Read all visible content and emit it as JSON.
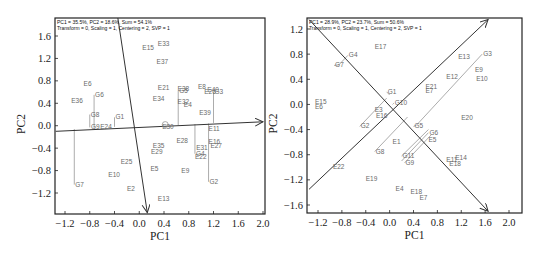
{
  "chart_data": [
    {
      "type": "scatter",
      "title": "PC1 = 35.5%, PC2 = 18.6%, Sum = 54.1%",
      "subtitle": "Transform = 0, Scaling = 1, Centering = 2, SVP = 1",
      "xlabel": "PC1",
      "ylabel": "PC2",
      "xlim": [
        -1.35,
        2.05
      ],
      "ylim": [
        -1.6,
        1.95
      ],
      "xticks": [
        -1.2,
        -0.8,
        -0.4,
        0.0,
        0.4,
        0.8,
        1.2,
        1.6,
        2.0
      ],
      "yticks": [
        1.6,
        1.2,
        0.8,
        0.4,
        0.0,
        -0.4,
        -0.8,
        -1.2
      ],
      "frame": {
        "x0": 55,
        "x1": 265,
        "y0": 18,
        "y1": 214
      },
      "axes_px": {
        "x_at": {
          "-1.2": 65,
          "2.0": 263
        },
        "y_at": {
          "1.6": 36,
          "-1.2": 193
        }
      },
      "vectors": [
        {
          "name": "axis-pc1",
          "x1": -1.35,
          "y1": -0.1,
          "x2": 2.0,
          "y2": 0.07
        },
        {
          "name": "axis-pc2",
          "x1": -0.35,
          "y1": 1.95,
          "x2": 0.13,
          "y2": -1.55
        }
      ],
      "testers": [
        {
          "label": "G6",
          "x": -0.73,
          "y": 0.55,
          "foot_y": -0.04
        },
        {
          "label": "G8",
          "x": -0.8,
          "y": 0.2,
          "foot_y": -0.03
        },
        {
          "label": "G1",
          "x": -0.4,
          "y": 0.15,
          "foot_y": -0.02
        },
        {
          "label": "G7",
          "x": -1.05,
          "y": -1.05,
          "foot_y": -0.06
        },
        {
          "label": "G5",
          "x": 0.63,
          "y": 0.62,
          "foot_y": 0.01
        },
        {
          "label": "G3",
          "x": 1.2,
          "y": 0.6,
          "foot_y": 0.05
        },
        {
          "label": "G2",
          "x": 1.12,
          "y": -1.0,
          "foot_y": 0.04
        },
        {
          "label": "G4",
          "x": 0.9,
          "y": -0.5,
          "foot_y": 0.03
        }
      ],
      "entries": [
        {
          "label": "E33",
          "x": 0.3,
          "y": 1.42
        },
        {
          "label": "E15",
          "x": 0.05,
          "y": 1.35
        },
        {
          "label": "E37",
          "x": 0.28,
          "y": 1.1
        },
        {
          "label": "E6",
          "x": -0.9,
          "y": 0.7
        },
        {
          "label": "E36",
          "x": -1.1,
          "y": 0.4
        },
        {
          "label": "E21",
          "x": 0.3,
          "y": 0.63
        },
        {
          "label": "E34",
          "x": 0.22,
          "y": 0.44
        },
        {
          "label": "E38",
          "x": 0.62,
          "y": 0.62
        },
        {
          "label": "E32",
          "x": 0.62,
          "y": 0.38
        },
        {
          "label": "E4",
          "x": 0.72,
          "y": 0.33
        },
        {
          "label": "E8",
          "x": 0.95,
          "y": 0.65
        },
        {
          "label": "E40",
          "x": 1.1,
          "y": 0.6
        },
        {
          "label": "E26",
          "x": 1.05,
          "y": 0.56
        },
        {
          "label": "E39",
          "x": 0.97,
          "y": 0.2
        },
        {
          "label": "E24",
          "x": -0.63,
          "y": -0.05
        },
        {
          "label": "G9",
          "x": -0.78,
          "y": -0.05
        },
        {
          "label": "E30",
          "x": 0.37,
          "y": -0.05
        },
        {
          "label": "E11",
          "x": 1.12,
          "y": -0.1
        },
        {
          "label": "E28",
          "x": 0.6,
          "y": -0.3
        },
        {
          "label": "E16",
          "x": 1.12,
          "y": -0.33
        },
        {
          "label": "E27",
          "x": 1.15,
          "y": -0.39
        },
        {
          "label": "E31",
          "x": 0.92,
          "y": -0.43
        },
        {
          "label": "E35",
          "x": 0.22,
          "y": -0.4
        },
        {
          "label": "E29",
          "x": 0.19,
          "y": -0.51
        },
        {
          "label": "E22",
          "x": 0.9,
          "y": -0.6
        },
        {
          "label": "E25",
          "x": -0.3,
          "y": -0.68
        },
        {
          "label": "E5",
          "x": 0.18,
          "y": -0.8
        },
        {
          "label": "E9",
          "x": 0.68,
          "y": -0.85
        },
        {
          "label": "E10",
          "x": -0.5,
          "y": -0.92
        },
        {
          "label": "E2",
          "x": -0.2,
          "y": -1.17
        },
        {
          "label": "E13",
          "x": 0.3,
          "y": -1.35
        }
      ]
    },
    {
      "type": "scatter",
      "title": "PC1 = 28.9%, PC2 = 23.7%, Sum = 50.6%",
      "subtitle": "Transform = 0, Scaling = 1, Centering = 2, SVP = 1",
      "xlabel": "PC1",
      "ylabel": "PC2",
      "xlim": [
        -1.4,
        2.2
      ],
      "ylim": [
        -1.7,
        1.4
      ],
      "xticks": [
        -1.2,
        -0.8,
        -0.4,
        0.0,
        0.4,
        0.8,
        1.2,
        1.6,
        2.0
      ],
      "yticks": [
        1.2,
        0.8,
        0.4,
        0.0,
        -0.4,
        -0.8,
        -1.2,
        -1.6
      ],
      "frame": {
        "x0": 307,
        "x1": 522,
        "y0": 18,
        "y1": 213
      },
      "axes_px": {
        "x_at": {
          "-1.2": 318,
          "2.0": 509
        },
        "y_at": {
          "1.2": 29,
          "-1.6": 205
        }
      },
      "vectors": [
        {
          "name": "axis-diag-up",
          "x1": -1.35,
          "y1": -1.35,
          "x2": 1.65,
          "y2": 1.35
        },
        {
          "name": "axis-diag-down",
          "x1": -1.35,
          "y1": 1.35,
          "x2": 1.65,
          "y2": -1.7
        }
      ],
      "testers": [
        {
          "label": "G4",
          "x": -0.7,
          "y": 0.78,
          "foot_x": -0.85,
          "foot_y": 0.63
        },
        {
          "label": "G7",
          "x": -0.93,
          "y": 0.62,
          "foot_x": -0.85,
          "foot_y": 0.63
        },
        {
          "label": "G1",
          "x": -0.05,
          "y": 0.2,
          "foot_x": 0.0,
          "foot_y": 0.15
        },
        {
          "label": "G10",
          "x": 0.07,
          "y": 0.02,
          "foot_x": 0.05,
          "foot_y": 0.0
        },
        {
          "label": "G2",
          "x": -0.5,
          "y": -0.35,
          "foot_x": -0.05,
          "foot_y": 0.1
        },
        {
          "label": "G3",
          "x": 1.55,
          "y": 0.8,
          "foot_x": 0.45,
          "foot_y": -0.33
        },
        {
          "label": "G5",
          "x": 0.4,
          "y": -0.35,
          "foot_x": 0.45,
          "foot_y": -0.33
        },
        {
          "label": "G8",
          "x": -0.25,
          "y": -0.75,
          "foot_x": 0.3,
          "foot_y": -0.2
        },
        {
          "label": "G6",
          "x": 0.65,
          "y": -0.45,
          "foot_x": 0.2,
          "foot_y": -0.9
        },
        {
          "label": "G9",
          "x": 0.25,
          "y": -0.93,
          "foot_x": 0.7,
          "foot_y": -0.48
        },
        {
          "label": "G11",
          "x": 0.2,
          "y": -0.82,
          "foot_x": 0.65,
          "foot_y": -0.4
        }
      ],
      "entries": [
        {
          "label": "E17",
          "x": -0.25,
          "y": 0.88
        },
        {
          "label": "E13",
          "x": 1.15,
          "y": 0.73
        },
        {
          "label": "E9",
          "x": 1.43,
          "y": 0.52
        },
        {
          "label": "E12",
          "x": 0.95,
          "y": 0.4
        },
        {
          "label": "E10",
          "x": 1.45,
          "y": 0.38
        },
        {
          "label": "E21",
          "x": 0.6,
          "y": 0.25
        },
        {
          "label": "E7",
          "x": 0.6,
          "y": 0.18
        },
        {
          "label": "E15",
          "x": -1.25,
          "y": 0.0
        },
        {
          "label": "E6",
          "x": -1.25,
          "y": -0.08
        },
        {
          "label": "E3",
          "x": -0.25,
          "y": -0.12
        },
        {
          "label": "E16",
          "x": -0.23,
          "y": -0.22
        },
        {
          "label": "E20",
          "x": 1.2,
          "y": -0.25
        },
        {
          "label": "E5",
          "x": 0.65,
          "y": -0.6
        },
        {
          "label": "E1",
          "x": 0.05,
          "y": -0.63
        },
        {
          "label": "E11",
          "x": 0.95,
          "y": -0.92
        },
        {
          "label": "E14",
          "x": 1.1,
          "y": -0.88
        },
        {
          "label": "E18",
          "x": 1.0,
          "y": -0.98
        },
        {
          "label": "E22",
          "x": -0.95,
          "y": -1.02
        },
        {
          "label": "E19",
          "x": -0.4,
          "y": -1.22
        },
        {
          "label": "E4",
          "x": 0.1,
          "y": -1.37
        },
        {
          "label": "E18b",
          "x": 0.35,
          "y": -1.42
        },
        {
          "label": "E7b",
          "x": 0.5,
          "y": -1.52
        }
      ]
    }
  ],
  "display_labels": {
    "E18b": "E18",
    "E7b": "E7"
  }
}
